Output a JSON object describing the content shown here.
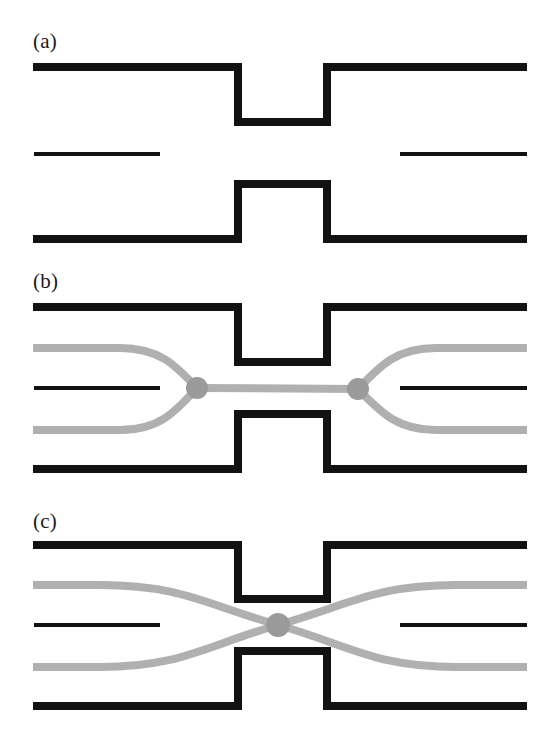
{
  "figure": {
    "width": 546,
    "height": 750,
    "background_color": "#ffffff",
    "wall_color": "#121212",
    "ray_color": "#b0b0b0",
    "node_color": "#9a9a9a",
    "panels": [
      {
        "id": "a",
        "label": "(a)",
        "label_position": {
          "x": 33,
          "y": 31
        },
        "description": "Empty waveguide with constriction: thick upper wall with downward notch, thin centre septum split left and right, thick lower wall with upward notch.",
        "has_rays": false
      },
      {
        "id": "b",
        "label": "(b)",
        "label_position": {
          "x": 33,
          "y": 271
        },
        "description": "Same geometry with two grey ray paths converging onto a node at the left throat entrance, running straight along the axis through the constriction, then diverging from a node at the right throat exit.",
        "has_rays": true,
        "node_count": 2,
        "nodes": [
          {
            "x": 197,
            "y": 388,
            "r": 11
          },
          {
            "x": 358,
            "y": 389,
            "r": 11
          }
        ]
      },
      {
        "id": "c",
        "label": "(c)",
        "label_position": {
          "x": 33,
          "y": 511
        },
        "description": "Same geometry with two grey ray paths crossing in a single X at the centre of the constriction, producing one node on the axis.",
        "has_rays": true,
        "node_count": 1,
        "nodes": [
          {
            "x": 278,
            "y": 625,
            "r": 12
          }
        ]
      }
    ],
    "geometry": {
      "plot_left": 33,
      "plot_right": 527,
      "throat_left_x": 238,
      "throat_right_x": 327,
      "wall_thickness": 8,
      "septum_thickness": 4,
      "septum_left_end": 160,
      "septum_right_start": 400,
      "panel_a": {
        "top_wall_y": 67,
        "notch_bottom_y": 122,
        "septum_y": 154,
        "bump_top_y": 184,
        "bottom_wall_y": 239
      },
      "panel_b": {
        "top_wall_y": 307,
        "notch_bottom_y": 362,
        "septum_y": 388,
        "bump_top_y": 414,
        "bottom_wall_y": 469,
        "upper_ray_y": 348,
        "lower_ray_y": 430
      },
      "panel_c": {
        "top_wall_y": 545,
        "notch_bottom_y": 599,
        "septum_y": 625,
        "bump_top_y": 651,
        "bottom_wall_y": 706,
        "upper_ray_y": 585,
        "lower_ray_y": 667
      },
      "ray_thickness": 8
    }
  }
}
